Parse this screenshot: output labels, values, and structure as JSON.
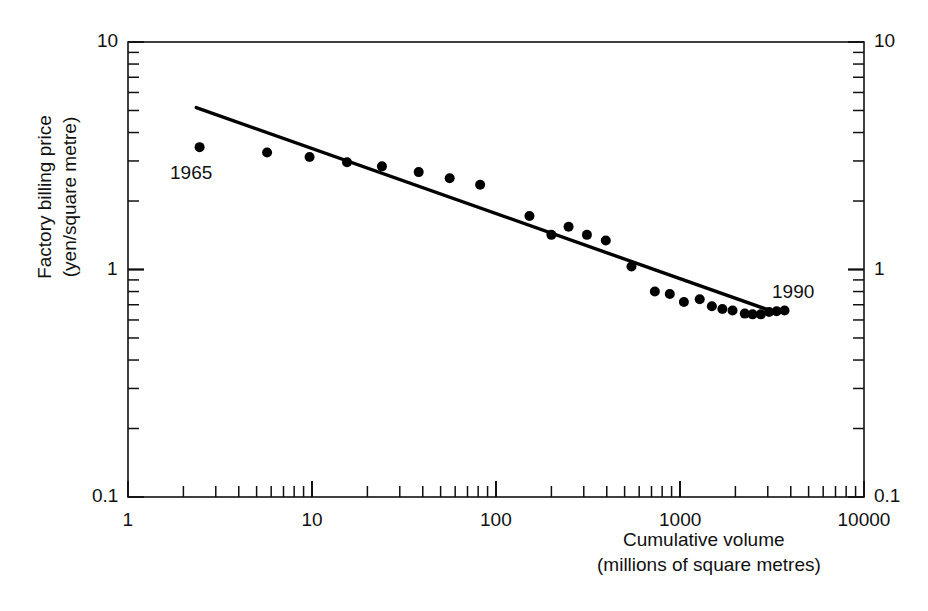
{
  "chart_data": {
    "type": "scatter",
    "title": "",
    "xlabel": "Cumulative volume\n(millions of square metres)",
    "xlabel_line1": "Cumulative volume",
    "xlabel_line2": "(millions of square metres)",
    "ylabel": "Factory billing price\n(yen/square metre)",
    "ylabel_line1": "Factory billing price",
    "ylabel_line2": "(yen/square metre)",
    "xscale": "log",
    "yscale": "log",
    "xlim": [
      1,
      10000
    ],
    "ylim": [
      0.1,
      10
    ],
    "grid": false,
    "legend": null,
    "x_tick_labels": [
      "1",
      "10",
      "100",
      "1000",
      "10000"
    ],
    "x_tick_values": [
      1,
      10,
      100,
      1000,
      10000
    ],
    "y_tick_labels": [
      "0.1",
      "1",
      "10"
    ],
    "y_tick_values": [
      0.1,
      1,
      10
    ],
    "y_tick_labels_right": [
      "0.1",
      "1",
      "10"
    ],
    "minor_ticks": true,
    "series": [
      {
        "name": "Factory billing price",
        "marker": "filled-circle",
        "color": "#000000",
        "points": [
          {
            "x": 2.45,
            "y": 3.45
          },
          {
            "x": 5.7,
            "y": 3.27
          },
          {
            "x": 9.7,
            "y": 3.12
          },
          {
            "x": 15.5,
            "y": 2.96
          },
          {
            "x": 24.0,
            "y": 2.84
          },
          {
            "x": 38.0,
            "y": 2.68
          },
          {
            "x": 56.0,
            "y": 2.52
          },
          {
            "x": 82.0,
            "y": 2.36
          },
          {
            "x": 152.0,
            "y": 1.72
          },
          {
            "x": 200.0,
            "y": 1.42
          },
          {
            "x": 248.0,
            "y": 1.54
          },
          {
            "x": 312.0,
            "y": 1.42
          },
          {
            "x": 395.0,
            "y": 1.34
          },
          {
            "x": 545.0,
            "y": 1.03
          },
          {
            "x": 730.0,
            "y": 0.8
          },
          {
            "x": 880.0,
            "y": 0.78
          },
          {
            "x": 1050.0,
            "y": 0.72
          },
          {
            "x": 1280.0,
            "y": 0.74
          },
          {
            "x": 1490.0,
            "y": 0.69
          },
          {
            "x": 1700.0,
            "y": 0.67
          },
          {
            "x": 1930.0,
            "y": 0.66
          },
          {
            "x": 2250.0,
            "y": 0.64
          },
          {
            "x": 2480.0,
            "y": 0.635
          },
          {
            "x": 2750.0,
            "y": 0.635
          },
          {
            "x": 3050.0,
            "y": 0.65
          },
          {
            "x": 3350.0,
            "y": 0.655
          },
          {
            "x": 3700.0,
            "y": 0.66
          }
        ]
      }
    ],
    "trendline": {
      "name": "experience-curve fit",
      "color": "#000000",
      "x_start": 2.35,
      "y_start": 5.15,
      "x_end": 3350.0,
      "y_end": 0.645
    },
    "annotations": [
      {
        "text": "1965",
        "x_px": 170,
        "y_px": 162,
        "anchor": "start"
      },
      {
        "text": "1990",
        "x_px": 772,
        "y_px": 281,
        "anchor": "start"
      }
    ]
  },
  "axes": {
    "x_title_line1": "Cumulative volume",
    "x_title_line2": "(millions of square metres)",
    "y_title_line1": "Factory billing price",
    "y_title_line2": "(yen/square metre)"
  }
}
